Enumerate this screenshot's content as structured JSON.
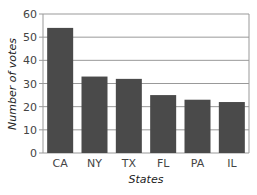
{
  "chart_data": {
    "type": "bar",
    "title": "",
    "xlabel": "States",
    "ylabel": "Number of votes",
    "categories": [
      "CA",
      "NY",
      "TX",
      "FL",
      "PA",
      "IL"
    ],
    "values": [
      54,
      33,
      32,
      25,
      23,
      22
    ],
    "ylim": [
      0,
      60
    ],
    "yticks": [
      0,
      10,
      20,
      30,
      40,
      50,
      60
    ],
    "grid": true,
    "bar_color": "#4a4a4a",
    "grid_color": "#999999"
  }
}
